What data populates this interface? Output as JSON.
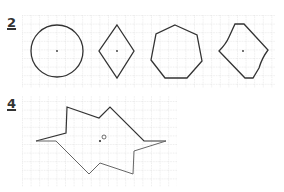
{
  "exercises": [
    {
      "number": "2",
      "shapes": [
        "circle",
        "rhombus",
        "heptagon",
        "irregular-hexagon"
      ]
    },
    {
      "number": "4",
      "shapes": [
        "irregular-star-polygon"
      ],
      "center_label": "O"
    }
  ],
  "colors": {
    "grid": "#c8c8c8",
    "stroke": "#333333",
    "stroke_light": "#666666"
  }
}
